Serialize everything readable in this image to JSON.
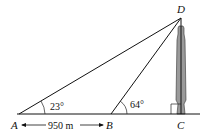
{
  "diagram": {
    "points": {
      "A": {
        "label": "A"
      },
      "B": {
        "label": "B"
      },
      "C": {
        "label": "C"
      },
      "D": {
        "label": "D"
      }
    },
    "angles": {
      "at_A": "23°",
      "at_B": "64°"
    },
    "distance_AB": "950 m",
    "right_angle_at": "C",
    "object": "tower"
  }
}
